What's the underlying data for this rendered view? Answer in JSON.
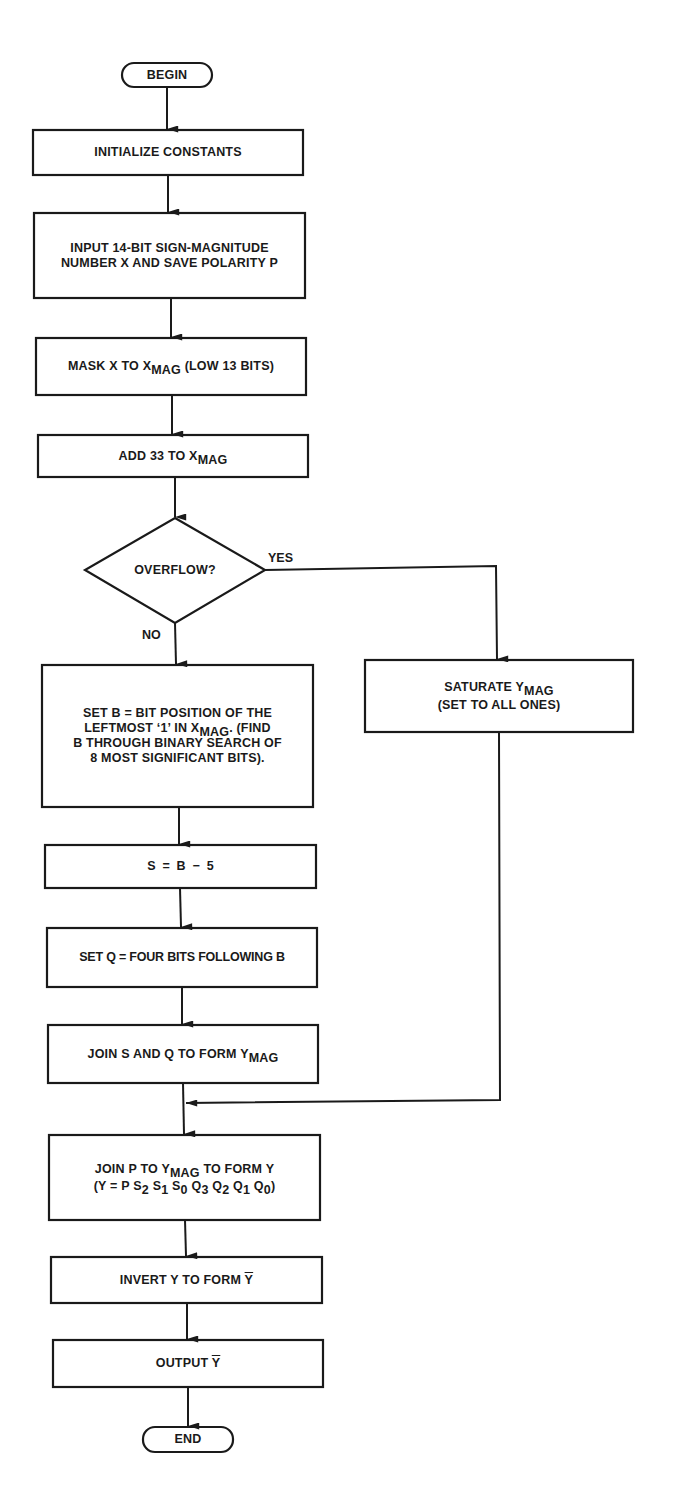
{
  "flowchart": {
    "begin": "BEGIN",
    "end": "END",
    "steps": {
      "init": "INITIALIZE CONSTANTS",
      "input_line1": "INPUT 14-BIT SIGN-MAGNITUDE",
      "input_line2": "NUMBER X AND SAVE POLARITY P",
      "mask_prefix": "MASK X TO X",
      "mask_sub": "MAG",
      "mask_suffix": " (LOW 13 BITS)",
      "add_prefix": "ADD 33 TO X",
      "add_sub": "MAG",
      "decision": "OVERFLOW?",
      "yes_label": "YES",
      "no_label": "NO",
      "saturate_prefix": "SATURATE Y",
      "saturate_sub": "MAG",
      "saturate_line2": "(SET TO ALL ONES)",
      "setb_line1": "SET B = BIT POSITION OF THE",
      "setb_line2_prefix": "LEFTMOST ‘1’ IN X",
      "setb_line2_sub": "MAG",
      "setb_line2_suffix": ". (FIND",
      "setb_line3": "B THROUGH BINARY SEARCH OF",
      "setb_line4": "8 MOST SIGNIFICANT BITS).",
      "s_eq": "S = B − 5",
      "setq": "SET Q = FOUR BITS FOLLOWING B",
      "joinsq_prefix": "JOIN S AND Q TO FORM Y",
      "joinsq_sub": "MAG",
      "joinp_line1_prefix": "JOIN P TO Y",
      "joinp_line1_sub": "MAG",
      "joinp_line1_suffix": " TO FORM Y",
      "joinp_line2": {
        "open": "(Y = P ",
        "terms": [
          {
            "base": "S",
            "sub": "2"
          },
          {
            "base": "S",
            "sub": "1"
          },
          {
            "base": "S",
            "sub": "0"
          },
          {
            "base": "Q",
            "sub": "3"
          },
          {
            "base": "Q",
            "sub": "2"
          },
          {
            "base": "Q",
            "sub": "1"
          },
          {
            "base": "Q",
            "sub": "0"
          }
        ],
        "close": ")"
      },
      "invert_prefix": "INVERT Y TO FORM ",
      "invert_var": "Y",
      "output_prefix": "OUTPUT ",
      "output_var": "Y"
    },
    "colors": {
      "stroke": "#1a1a1a",
      "background": "#ffffff"
    }
  }
}
